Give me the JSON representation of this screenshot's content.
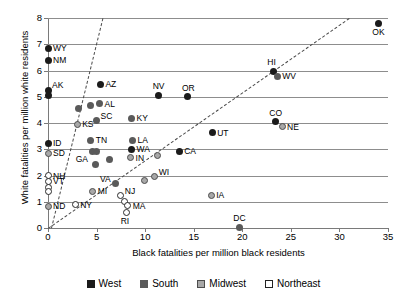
{
  "chart_data": {
    "type": "scatter",
    "title": "",
    "xlabel": "Black fatalities per million black residents",
    "ylabel": "White fatalities per million white residents",
    "xlim": [
      0,
      35
    ],
    "ylim": [
      0,
      8
    ],
    "xticks": [
      0,
      5,
      10,
      15,
      20,
      25,
      30,
      35
    ],
    "yticks": [
      0,
      1,
      2,
      3,
      4,
      5,
      6,
      7,
      8
    ],
    "grid": "horizontal",
    "legend_position": "bottom",
    "legend": [
      {
        "label": "West",
        "color": "#1b1b1b",
        "marker": "filled-square"
      },
      {
        "label": "South",
        "color": "#5a5a5a",
        "marker": "filled-square"
      },
      {
        "label": "Midwest",
        "color": "#a8a8a8",
        "marker": "shaded-square"
      },
      {
        "label": "Northeast",
        "color": "#ffffff",
        "marker": "open-square"
      }
    ],
    "annotations": [
      {
        "name": "parity-line",
        "kind": "dashed-line",
        "from": [
          0,
          0
        ],
        "to": [
          31.0,
          8.0
        ]
      },
      {
        "name": "steep-reference-line",
        "kind": "dashed-line",
        "from": [
          0.3,
          0.0
        ],
        "to": [
          5.6,
          8.0
        ]
      }
    ],
    "points": [
      {
        "label": "WY",
        "x": 0.0,
        "y": 6.85,
        "group": "West",
        "label_side": "right"
      },
      {
        "label": "NM",
        "x": 0.0,
        "y": 6.4,
        "group": "West",
        "label_side": "right"
      },
      {
        "label": "AK",
        "x": 0.0,
        "y": 5.25,
        "group": "West",
        "label_side": "right-up"
      },
      {
        "label": "",
        "x": 0.0,
        "y": 5.05,
        "group": "West",
        "label_side": "none"
      },
      {
        "label": "ID",
        "x": 0.0,
        "y": 3.22,
        "group": "West",
        "label_side": "right"
      },
      {
        "label": "SD",
        "x": 0.0,
        "y": 2.85,
        "group": "Midwest",
        "label_side": "right"
      },
      {
        "label": "NH",
        "x": 0.0,
        "y": 2.0,
        "group": "Northeast",
        "label_side": "right"
      },
      {
        "label": "VT",
        "x": 0.0,
        "y": 1.78,
        "group": "Northeast",
        "label_side": "right"
      },
      {
        "label": "",
        "x": 0.0,
        "y": 1.55,
        "group": "Northeast",
        "label_side": "none"
      },
      {
        "label": "",
        "x": 0.0,
        "y": 1.4,
        "group": "Northeast",
        "label_side": "none"
      },
      {
        "label": "ND",
        "x": 0.0,
        "y": 0.82,
        "group": "Midwest",
        "label_side": "right"
      },
      {
        "label": "KS",
        "x": 3.0,
        "y": 3.96,
        "group": "Midwest",
        "label_side": "right"
      },
      {
        "label": "",
        "x": 3.1,
        "y": 4.55,
        "group": "South",
        "label_side": "none"
      },
      {
        "label": "",
        "x": 4.4,
        "y": 4.68,
        "group": "South",
        "label_side": "none"
      },
      {
        "label": "AZ",
        "x": 5.4,
        "y": 5.47,
        "group": "West",
        "label_side": "right"
      },
      {
        "label": "AL",
        "x": 5.3,
        "y": 4.73,
        "group": "South",
        "label_side": "right"
      },
      {
        "label": "SC",
        "x": 5.0,
        "y": 4.08,
        "group": "South",
        "label_side": "right-up"
      },
      {
        "label": "TN",
        "x": 4.4,
        "y": 3.35,
        "group": "South",
        "label_side": "right"
      },
      {
        "label": "GA",
        "x": 4.6,
        "y": 2.93,
        "group": "South",
        "label_side": "below-left"
      },
      {
        "label": "",
        "x": 5.0,
        "y": 2.93,
        "group": "South",
        "label_side": "none"
      },
      {
        "label": "",
        "x": 4.9,
        "y": 2.43,
        "group": "South",
        "label_side": "none"
      },
      {
        "label": "",
        "x": 6.3,
        "y": 2.62,
        "group": "South",
        "label_side": "none"
      },
      {
        "label": "VA",
        "x": 6.9,
        "y": 1.68,
        "group": "South",
        "label_side": "left-up"
      },
      {
        "label": "MI",
        "x": 4.6,
        "y": 1.4,
        "group": "Midwest",
        "label_side": "right"
      },
      {
        "label": "NY",
        "x": 2.8,
        "y": 0.88,
        "group": "Northeast",
        "label_side": "right"
      },
      {
        "label": "NJ",
        "x": 7.5,
        "y": 1.22,
        "group": "Northeast",
        "label_side": "right-up"
      },
      {
        "label": "",
        "x": 7.9,
        "y": 1.0,
        "group": "Northeast",
        "label_side": "none"
      },
      {
        "label": "MA",
        "x": 8.2,
        "y": 0.85,
        "group": "Northeast",
        "label_side": "right"
      },
      {
        "label": "RI",
        "x": 8.1,
        "y": 0.6,
        "group": "Northeast",
        "label_side": "below"
      },
      {
        "label": "KY",
        "x": 8.6,
        "y": 4.18,
        "group": "South",
        "label_side": "right"
      },
      {
        "label": "LA",
        "x": 8.7,
        "y": 3.35,
        "group": "South",
        "label_side": "right"
      },
      {
        "label": "WA",
        "x": 8.6,
        "y": 3.0,
        "group": "West",
        "label_side": "right"
      },
      {
        "label": "IN",
        "x": 8.5,
        "y": 2.67,
        "group": "Midwest",
        "label_side": "right"
      },
      {
        "label": "",
        "x": 11.3,
        "y": 2.75,
        "group": "Midwest",
        "label_side": "none"
      },
      {
        "label": "",
        "x": 9.9,
        "y": 1.82,
        "group": "Midwest",
        "label_side": "none"
      },
      {
        "label": "WI",
        "x": 11.0,
        "y": 1.95,
        "group": "Midwest",
        "label_side": "right-up"
      },
      {
        "label": "NV",
        "x": 11.4,
        "y": 5.05,
        "group": "West",
        "label_side": "above"
      },
      {
        "label": "OR",
        "x": 14.4,
        "y": 5.0,
        "group": "West",
        "label_side": "above"
      },
      {
        "label": "CA",
        "x": 13.5,
        "y": 2.93,
        "group": "West",
        "label_side": "right"
      },
      {
        "label": "UT",
        "x": 16.9,
        "y": 3.62,
        "group": "West",
        "label_side": "right"
      },
      {
        "label": "IA",
        "x": 16.8,
        "y": 1.25,
        "group": "Midwest",
        "label_side": "right"
      },
      {
        "label": "DC",
        "x": 19.7,
        "y": 0.03,
        "group": "South",
        "label_side": "above"
      },
      {
        "label": "CO",
        "x": 23.4,
        "y": 4.05,
        "group": "West",
        "label_side": "above"
      },
      {
        "label": "NE",
        "x": 24.1,
        "y": 3.85,
        "group": "Midwest",
        "label_side": "right"
      },
      {
        "label": "HI",
        "x": 23.2,
        "y": 5.97,
        "group": "West",
        "label_side": "above"
      },
      {
        "label": "WV",
        "x": 23.6,
        "y": 5.78,
        "group": "South",
        "label_side": "right"
      },
      {
        "label": "OK",
        "x": 34.0,
        "y": 7.8,
        "group": "West",
        "label_side": "below"
      }
    ]
  }
}
